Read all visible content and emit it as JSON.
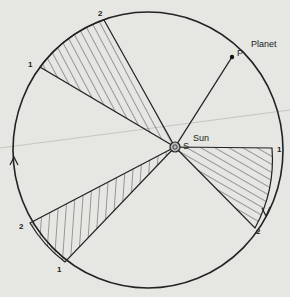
{
  "diagram": {
    "labels": {
      "planet": "Planet",
      "planet_point": "P",
      "sun": "Sun",
      "sun_point": "S",
      "sector_a_start": "1",
      "sector_a_end": "2",
      "sector_b_start": "1",
      "sector_b_end": "2",
      "sector_c_start": "2",
      "sector_c_end": "1"
    },
    "colors": {
      "background": "#e6e6e3",
      "ink": "#222222"
    }
  }
}
